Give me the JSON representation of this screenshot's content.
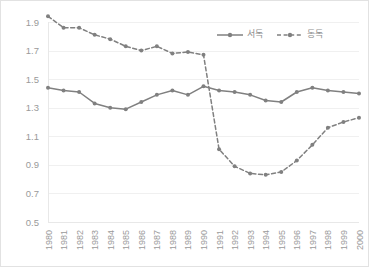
{
  "chart_data": {
    "type": "line",
    "title": "",
    "subtitle": "",
    "xlabel": "",
    "ylabel": "",
    "x": [
      "1980",
      "1981",
      "1982",
      "1983",
      "1984",
      "1985",
      "1986",
      "1987",
      "1988",
      "1989",
      "1990",
      "1991",
      "1992",
      "1993",
      "1994",
      "1995",
      "1996",
      "1997",
      "1998",
      "1999",
      "2000"
    ],
    "categories": [
      "1980",
      "1981",
      "1982",
      "1983",
      "1984",
      "1985",
      "1986",
      "1987",
      "1988",
      "1989",
      "1990",
      "1991",
      "1992",
      "1993",
      "1994",
      "1995",
      "1996",
      "1997",
      "1998",
      "1999",
      "2000"
    ],
    "series": [
      {
        "name": "서독",
        "style": "solid",
        "color": "#808080",
        "marker": "circle",
        "values": [
          1.44,
          1.42,
          1.41,
          1.33,
          1.3,
          1.29,
          1.34,
          1.39,
          1.42,
          1.39,
          1.45,
          1.42,
          1.41,
          1.39,
          1.35,
          1.34,
          1.41,
          1.44,
          1.42,
          1.41,
          1.4
        ]
      },
      {
        "name": "동독",
        "style": "dashed",
        "color": "#808080",
        "marker": "circle",
        "values": [
          1.94,
          1.86,
          1.86,
          1.81,
          1.78,
          1.73,
          1.7,
          1.73,
          1.68,
          1.69,
          1.67,
          1.01,
          0.89,
          0.84,
          0.83,
          0.85,
          0.93,
          1.04,
          1.16,
          1.2,
          1.23
        ]
      }
    ],
    "ylim": [
      0.5,
      1.9
    ],
    "ytick_step": 0.2,
    "yticks": [
      "1.9",
      "1.7",
      "1.5",
      "1.3",
      "1.1",
      "0.9",
      "0.7",
      "0.5"
    ],
    "ytick_values": [
      1.9,
      1.7,
      1.5,
      1.3,
      1.1,
      0.9,
      0.7,
      0.5
    ],
    "grid": true,
    "grid_color": "#f0f0f0",
    "legend_position": "top-right",
    "legend": [
      "서독",
      "동독"
    ],
    "background_color": "#ffffff",
    "border_color": "#e2e2e2",
    "tick_label_color": "#9a9a9a",
    "x_label_rotation": -90
  }
}
